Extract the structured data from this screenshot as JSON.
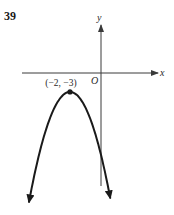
{
  "problem": {
    "number": "39"
  },
  "chart_data": {
    "type": "line",
    "title": "",
    "xlabel": "x",
    "ylabel": "y",
    "origin_label": "O",
    "function": "parabola opening downward",
    "vertex": {
      "x": -2,
      "y": -3,
      "label": "(−2, −3)"
    },
    "series": [
      {
        "name": "parabola",
        "vertex": [
          -2,
          -3
        ],
        "opens": "down",
        "arrows_at_ends": true
      }
    ],
    "grid": false,
    "axis_arrows": true
  }
}
